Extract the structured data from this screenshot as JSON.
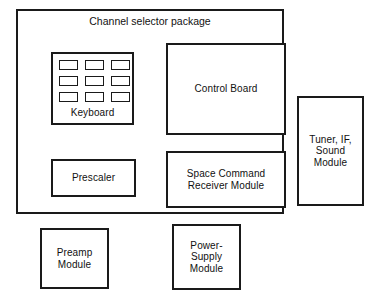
{
  "diagram": {
    "title": "Channel selector package",
    "background_color": "#ffffff",
    "line_color": "#1a1a1a",
    "text_color": "#111111",
    "blocks": {
      "keyboard": {
        "label": "Keyboard",
        "keypad_rows": 3,
        "keypad_columns": 3,
        "keypad_count": 9
      },
      "control_board": {
        "label": "Control Board"
      },
      "prescaler": {
        "label": "Prescaler"
      },
      "space_command_receiver": {
        "label": "Space Command\nReceiver Module"
      },
      "tuner_if_sound": {
        "label": "Tuner, IF,\nSound\nModule"
      },
      "preamp": {
        "label": "Preamp\nModule"
      },
      "power_supply": {
        "label": "Power-\nSupply\nModule"
      }
    }
  }
}
